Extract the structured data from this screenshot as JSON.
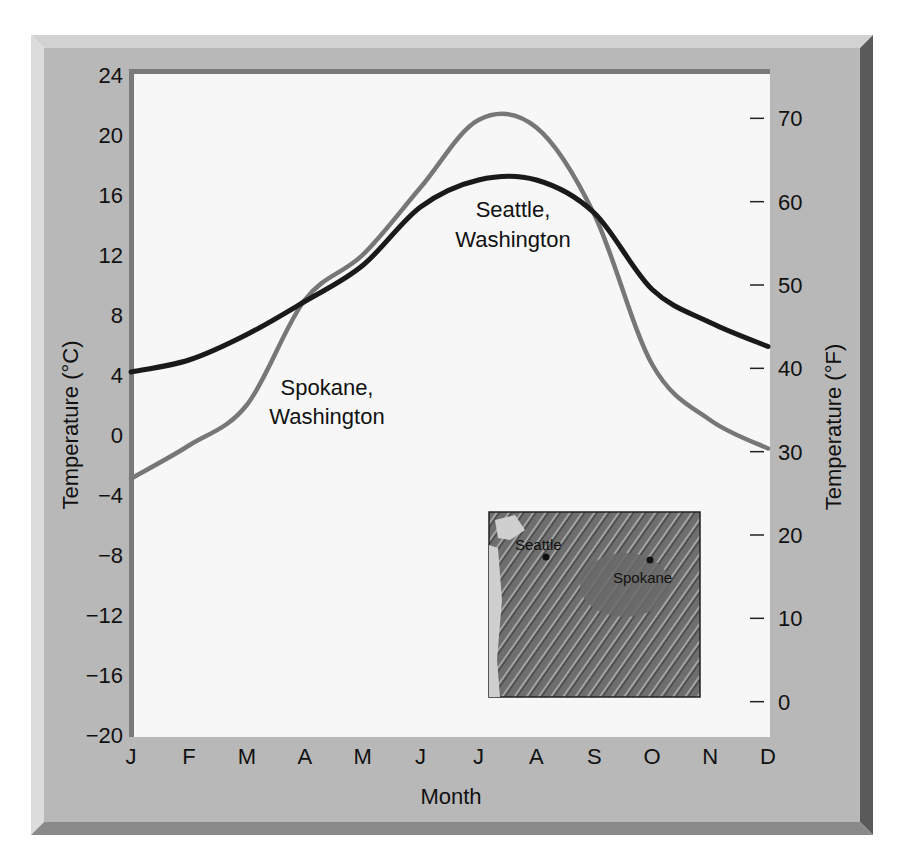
{
  "chart_data": {
    "type": "line",
    "title": "",
    "xlabel": "Month",
    "ylabel": "Temperature (°C)",
    "ylabel_right": "Temperature (°F)",
    "categories": [
      "J",
      "F",
      "M",
      "A",
      "M",
      "J",
      "J",
      "A",
      "S",
      "O",
      "N",
      "D"
    ],
    "ylim": [
      -20,
      24
    ],
    "yticks": [
      24,
      20,
      16,
      12,
      8,
      4,
      0,
      -4,
      -8,
      -12,
      -16,
      -20
    ],
    "ytick_labels": [
      "24",
      "20",
      "16",
      "12",
      "8",
      "4",
      "0",
      "−4",
      "−8",
      "−12",
      "−16",
      "−20"
    ],
    "yticks_right": [
      70,
      60,
      50,
      40,
      30,
      20,
      10,
      0
    ],
    "ytick_right_labels": [
      "70",
      "60",
      "50",
      "40",
      "30",
      "20",
      "10",
      "0"
    ],
    "grid": false,
    "legend": "none (inline labels)",
    "series": [
      {
        "name": "Seattle, Washington",
        "label_line1": "Seattle,",
        "label_line2": "Washington",
        "color": "#1a1a1a",
        "values": [
          4.2,
          5.0,
          6.7,
          8.9,
          11.3,
          15.2,
          17.0,
          17.0,
          14.8,
          9.7,
          7.5,
          5.9
        ]
      },
      {
        "name": "Spokane, Washington",
        "label_line1": "Spokane,",
        "label_line2": "Washington",
        "color": "#777777",
        "values": [
          -2.9,
          -0.7,
          2.0,
          9.0,
          12.0,
          16.5,
          21.0,
          20.5,
          14.7,
          4.7,
          1.0,
          -0.9
        ]
      }
    ],
    "inset_map": {
      "description": "Shaded relief map of Washington state",
      "labels": [
        "Seattle",
        "Spokane"
      ]
    }
  },
  "colors": {
    "frame": "#b4b4b4",
    "frame_light": "#d2d2d2",
    "frame_dark": "#5a5a5a",
    "plot_bg": "#f7f7f7",
    "plot_border": "#7a7a7a"
  }
}
